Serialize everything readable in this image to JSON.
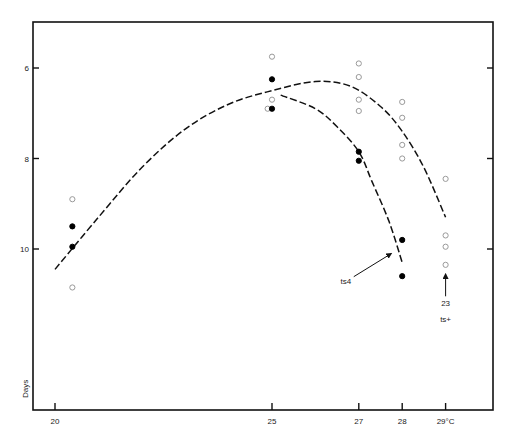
{
  "chart_data": {
    "type": "scatter",
    "title": "",
    "xlabel": "°C",
    "ylabel": "Days",
    "xlim": [
      18.5,
      30.0
    ],
    "ylim": [
      14.0,
      4.85
    ],
    "y_inverted": true,
    "grid": false,
    "legend": "none",
    "x_ticks": [
      20,
      25,
      27,
      28,
      29
    ],
    "x_tick_labels": [
      "20",
      "25",
      "27",
      "28",
      "29°C"
    ],
    "y_ticks": [
      6,
      8,
      10
    ],
    "y_tick_labels": [
      "6",
      "8",
      "10"
    ],
    "series": [
      {
        "name": "open circles",
        "marker": "open-circle",
        "points": [
          [
            20.4,
            8.9
          ],
          [
            20.4,
            10.85
          ],
          [
            25.0,
            5.75
          ],
          [
            25.0,
            6.7
          ],
          [
            24.9,
            6.9
          ],
          [
            27.0,
            5.9
          ],
          [
            27.0,
            6.2
          ],
          [
            27.0,
            6.7
          ],
          [
            27.0,
            6.95
          ],
          [
            28.0,
            6.75
          ],
          [
            28.0,
            7.1
          ],
          [
            28.0,
            7.7
          ],
          [
            28.0,
            8.0
          ],
          [
            29.0,
            8.45
          ],
          [
            29.0,
            9.7
          ],
          [
            29.0,
            9.95
          ],
          [
            29.0,
            10.35
          ]
        ]
      },
      {
        "name": "filled circles",
        "marker": "filled-circle",
        "points": [
          [
            20.4,
            9.5
          ],
          [
            20.4,
            9.95
          ],
          [
            25.0,
            6.25
          ],
          [
            25.0,
            6.9
          ],
          [
            27.0,
            7.85
          ],
          [
            27.0,
            8.05
          ],
          [
            28.0,
            9.8
          ],
          [
            28.0,
            10.6
          ]
        ]
      }
    ],
    "curves": [
      {
        "name": "upper dashed curve",
        "style": "dashed",
        "points": [
          [
            20.0,
            10.45
          ],
          [
            21.0,
            9.3
          ],
          [
            22.0,
            8.2
          ],
          [
            23.0,
            7.35
          ],
          [
            24.0,
            6.8
          ],
          [
            25.0,
            6.5
          ],
          [
            26.0,
            6.3
          ],
          [
            26.8,
            6.4
          ],
          [
            27.5,
            6.85
          ],
          [
            28.0,
            7.4
          ],
          [
            28.5,
            8.2
          ],
          [
            29.0,
            9.3
          ]
        ]
      },
      {
        "name": "lower dashed curve (ts4)",
        "style": "dashed",
        "points": [
          [
            25.2,
            6.6
          ],
          [
            26.0,
            6.9
          ],
          [
            26.5,
            7.3
          ],
          [
            27.0,
            7.85
          ],
          [
            27.3,
            8.5
          ],
          [
            27.7,
            9.4
          ],
          [
            28.0,
            10.3
          ]
        ]
      }
    ],
    "annotations": [
      {
        "text": "ts4",
        "x": 26.7,
        "y": 10.7,
        "arrow_to": [
          27.75,
          10.1
        ]
      },
      {
        "text": "23",
        "x": 29.0,
        "y": 11.2,
        "arrow_to": [
          29.0,
          10.55
        ]
      },
      {
        "text": "ts+",
        "x": 29.0,
        "y": 11.55
      }
    ]
  },
  "axes": {
    "y_title": "Days",
    "x_unit": "°C"
  }
}
